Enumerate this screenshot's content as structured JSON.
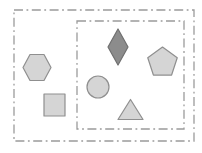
{
  "canvas": {
    "width": 202,
    "height": 153,
    "background": "#ffffff"
  },
  "colors": {
    "frame_line": "#9b9b9b",
    "light_fill": "#d5d5d5",
    "light_stroke": "#8f8f8f",
    "dark_fill": "#8c8c8c",
    "dark_stroke": "#6f6f6f"
  },
  "frames": [
    {
      "name": "outer-boundary",
      "x": 14,
      "y": 10,
      "width": 180,
      "height": 131,
      "style": "dash-dot"
    },
    {
      "name": "inner-boundary",
      "x": 77,
      "y": 21,
      "width": 107,
      "height": 108,
      "style": "dash-dot"
    }
  ],
  "shapes": [
    {
      "name": "hexagon",
      "type": "hexagon",
      "cx": 37,
      "cy": 67.5,
      "rx": 14,
      "ry": 13,
      "fill": "light"
    },
    {
      "name": "square",
      "type": "square",
      "cx": 54.5,
      "cy": 105,
      "rx": 10.5,
      "ry": 11,
      "fill": "light"
    },
    {
      "name": "circle",
      "type": "circle",
      "cx": 98,
      "cy": 87,
      "rx": 11,
      "ry": 11,
      "fill": "light"
    },
    {
      "name": "diamond",
      "type": "diamond",
      "cx": 118,
      "cy": 47,
      "rx": 10,
      "ry": 18,
      "fill": "dark"
    },
    {
      "name": "triangle",
      "type": "triangle",
      "cx": 130.5,
      "cy": 109.5,
      "rx": 12.5,
      "ry": 10,
      "fill": "light"
    },
    {
      "name": "pentagon",
      "type": "pentagon",
      "cx": 162.5,
      "cy": 62.5,
      "rx": 15.5,
      "ry": 15.5,
      "fill": "light"
    }
  ]
}
